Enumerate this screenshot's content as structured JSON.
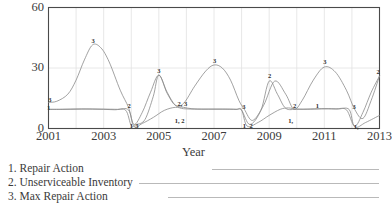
{
  "chart_data": {
    "type": "line",
    "title": "",
    "xlabel": "Year",
    "ylabel": "",
    "xlim": [
      2001,
      2013
    ],
    "ylim": [
      0,
      60
    ],
    "yticks": [
      0,
      30,
      60
    ],
    "xticks": [
      2001,
      2003,
      2005,
      2007,
      2009,
      2011,
      2013
    ],
    "grid": true,
    "legend_position": "below",
    "series": [
      {
        "name": "Repair Action",
        "key": "1",
        "x": [
          2001.0,
          2001.5,
          2002.0,
          2002.5,
          2003.0,
          2003.5,
          2003.9,
          2004.1,
          2004.4,
          2004.8,
          2005.2,
          2005.6,
          2005.9,
          2006.3,
          2006.8,
          2007.3,
          2007.8,
          2008.0,
          2008.2,
          2008.6,
          2009.0,
          2009.4,
          2009.7,
          2010.0,
          2010.5,
          2011.0,
          2011.5,
          2011.9,
          2012.1,
          2012.5,
          2013.0
        ],
        "y": [
          9.5,
          9.5,
          9.6,
          9.7,
          9.6,
          9.5,
          9.2,
          1.0,
          2.5,
          5.5,
          9.0,
          10.5,
          9.8,
          9.6,
          9.6,
          9.6,
          9.5,
          9.3,
          1.2,
          3.0,
          6.5,
          9.5,
          10.2,
          9.6,
          9.6,
          9.8,
          9.7,
          9.4,
          0.8,
          3.0,
          6.5
        ]
      },
      {
        "name": "Unserviceable Inventory",
        "key": "2",
        "x": [
          2001.0,
          2001.4,
          2001.8,
          2002.2,
          2002.6,
          2003.0,
          2003.4,
          2003.8,
          2004.0,
          2004.2,
          2004.5,
          2004.8,
          2005.0,
          2005.3,
          2005.6,
          2005.9,
          2006.2,
          2006.6,
          2007.0,
          2007.4,
          2007.8,
          2008.0,
          2008.3,
          2008.7,
          2009.0,
          2009.3,
          2009.6,
          2010.0,
          2010.4,
          2010.9,
          2011.4,
          2011.8,
          2012.1,
          2012.4,
          2012.7,
          2013.0
        ],
        "y": [
          9.5,
          9.5,
          9.6,
          9.7,
          9.6,
          9.5,
          9.3,
          9.0,
          1.5,
          2.0,
          4.5,
          16.0,
          26.5,
          18.0,
          11.5,
          10.5,
          9.8,
          9.6,
          9.6,
          9.6,
          9.5,
          9.0,
          2.0,
          9.0,
          23.5,
          17.0,
          10.0,
          9.6,
          9.6,
          9.8,
          9.7,
          9.3,
          1.2,
          8.0,
          18.0,
          26.0
        ]
      },
      {
        "name": "Max Repair Action",
        "key": "3",
        "x": [
          2001.0,
          2001.3,
          2001.7,
          2002.0,
          2002.3,
          2002.6,
          2002.9,
          2003.2,
          2003.6,
          2003.9,
          2004.1,
          2004.4,
          2004.7,
          2005.0,
          2005.3,
          2005.6,
          2005.9,
          2006.3,
          2006.7,
          2007.0,
          2007.3,
          2007.6,
          2007.9,
          2008.1,
          2008.4,
          2008.8,
          2009.2,
          2009.6,
          2009.9,
          2010.2,
          2010.6,
          2011.0,
          2011.4,
          2011.8,
          2012.1,
          2012.4,
          2012.7,
          2013.0
        ],
        "y": [
          13.0,
          13.5,
          17.0,
          24.0,
          34.0,
          41.5,
          40.0,
          33.0,
          19.0,
          10.5,
          2.0,
          8.0,
          18.0,
          26.5,
          17.5,
          11.5,
          12.5,
          21.0,
          28.5,
          31.5,
          30.0,
          24.0,
          14.0,
          9.5,
          4.0,
          11.5,
          23.5,
          17.0,
          9.5,
          14.0,
          24.0,
          30.5,
          28.0,
          19.0,
          9.5,
          5.0,
          14.0,
          26.0
        ]
      }
    ],
    "point_labels": [
      {
        "text": "3",
        "x": 2001.05,
        "y": 14.5
      },
      {
        "text": "1",
        "x": 2001.0,
        "y": 10.6
      },
      {
        "text": "3",
        "x": 2002.62,
        "y": 44.0
      },
      {
        "text": "2",
        "x": 2003.92,
        "y": 11.5
      },
      {
        "text": "1",
        "x": 2004.0,
        "y": 1.8
      },
      {
        "text": "3",
        "x": 2004.2,
        "y": 1.8
      },
      {
        "text": "3",
        "x": 2005.0,
        "y": 29.0
      },
      {
        "text": "2, 3",
        "x": 2005.85,
        "y": 12.5
      },
      {
        "text": "1, 2",
        "x": 2005.75,
        "y": 4.0
      },
      {
        "text": "3",
        "x": 2007.02,
        "y": 34.0
      },
      {
        "text": "3",
        "x": 2008.08,
        "y": 11.0
      },
      {
        "text": "1",
        "x": 2008.1,
        "y": 1.8
      },
      {
        "text": "2",
        "x": 2008.35,
        "y": 1.8
      },
      {
        "text": "2",
        "x": 2009.02,
        "y": 26.5
      },
      {
        "text": "2",
        "x": 2009.92,
        "y": 11.5
      },
      {
        "text": "1,",
        "x": 2009.78,
        "y": 4.0
      },
      {
        "text": "1",
        "x": 2010.75,
        "y": 11.5
      },
      {
        "text": "3",
        "x": 2011.02,
        "y": 33.5
      },
      {
        "text": "3",
        "x": 2012.08,
        "y": 11.0
      },
      {
        "text": "1,",
        "x": 2012.15,
        "y": 1.2
      },
      {
        "text": "2",
        "x": 2012.95,
        "y": 28.5
      }
    ]
  },
  "legend": {
    "entries": [
      {
        "label": "1. Repair Action"
      },
      {
        "label": "2. Unserviceable Inventory"
      },
      {
        "label": "3. Max Repair Action"
      }
    ]
  },
  "colors": {
    "line": "#8a8a8a",
    "axis": "#4a4a4a",
    "grid": "#e2e2e2",
    "text": "#3a3a3a",
    "background": "#ffffff"
  }
}
